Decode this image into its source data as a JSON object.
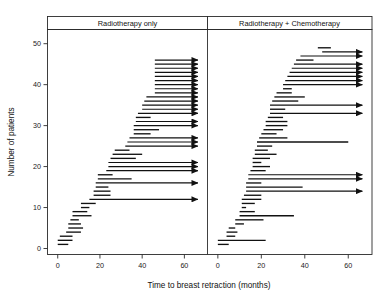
{
  "figure": {
    "title": "",
    "xlabel": "Time to breast retraction (months)",
    "ylabel": "Number of patients"
  },
  "chart_data": {
    "type": "line",
    "title": "",
    "xlabel": "Time to breast retraction (months)",
    "ylabel": "Number of patients",
    "xlim": [
      -2,
      70
    ],
    "ylim": [
      0,
      52
    ],
    "xticks": [
      0,
      20,
      40,
      60
    ],
    "yticks": [
      0,
      10,
      20,
      30,
      40,
      50
    ],
    "grid": false,
    "legend": "none",
    "panel_layout": "two-panels-side-by-side",
    "annotation": "Interval-censored observation times; arrows denote right-censored intervals extending beyond the observation window.",
    "panels": [
      {
        "name": "radiotherapy-only",
        "label": "Radiotherapy only",
        "n": 46,
        "intervals": [
          {
            "y": 1,
            "left": 0,
            "right": 5,
            "censored": false
          },
          {
            "y": 2,
            "left": 0,
            "right": 7,
            "censored": false
          },
          {
            "y": 3,
            "left": 1,
            "right": 7,
            "censored": false
          },
          {
            "y": 4,
            "left": 4,
            "right": 11,
            "censored": false
          },
          {
            "y": 5,
            "left": 5,
            "right": 12,
            "censored": false
          },
          {
            "y": 6,
            "left": 5,
            "right": 11,
            "censored": false
          },
          {
            "y": 7,
            "left": 6,
            "right": 10,
            "censored": false
          },
          {
            "y": 8,
            "left": 7,
            "right": 16,
            "censored": false
          },
          {
            "y": 9,
            "left": 7,
            "right": 14,
            "censored": false
          },
          {
            "y": 10,
            "left": 11,
            "right": 15,
            "censored": false
          },
          {
            "y": 11,
            "left": 11,
            "right": 18,
            "censored": false
          },
          {
            "y": 12,
            "left": 15,
            "right": 69,
            "censored": true
          },
          {
            "y": 13,
            "left": 17,
            "right": 25,
            "censored": false
          },
          {
            "y": 14,
            "left": 17,
            "right": 25,
            "censored": false
          },
          {
            "y": 15,
            "left": 18,
            "right": 24,
            "censored": false
          },
          {
            "y": 16,
            "left": 18,
            "right": 69,
            "censored": true
          },
          {
            "y": 17,
            "left": 19,
            "right": 35,
            "censored": false
          },
          {
            "y": 18,
            "left": 19,
            "right": 26,
            "censored": false
          },
          {
            "y": 19,
            "left": 23,
            "right": 69,
            "censored": true
          },
          {
            "y": 20,
            "left": 24,
            "right": 69,
            "censored": true
          },
          {
            "y": 21,
            "left": 24,
            "right": 69,
            "censored": true
          },
          {
            "y": 22,
            "left": 25,
            "right": 37,
            "censored": false
          },
          {
            "y": 23,
            "left": 26,
            "right": 40,
            "censored": false
          },
          {
            "y": 24,
            "left": 27,
            "right": 34,
            "censored": false
          },
          {
            "y": 25,
            "left": 32,
            "right": 69,
            "censored": true
          },
          {
            "y": 26,
            "left": 33,
            "right": 69,
            "censored": true
          },
          {
            "y": 27,
            "left": 34,
            "right": 69,
            "censored": true
          },
          {
            "y": 28,
            "left": 36,
            "right": 44,
            "censored": false
          },
          {
            "y": 29,
            "left": 36,
            "right": 48,
            "censored": false
          },
          {
            "y": 30,
            "left": 36,
            "right": 69,
            "censored": true
          },
          {
            "y": 31,
            "left": 37,
            "right": 69,
            "censored": true
          },
          {
            "y": 32,
            "left": 37,
            "right": 44,
            "censored": false
          },
          {
            "y": 33,
            "left": 38,
            "right": 69,
            "censored": true
          },
          {
            "y": 34,
            "left": 40,
            "right": 69,
            "censored": true
          },
          {
            "y": 35,
            "left": 40,
            "right": 69,
            "censored": true
          },
          {
            "y": 36,
            "left": 41,
            "right": 69,
            "censored": true
          },
          {
            "y": 37,
            "left": 42,
            "right": 69,
            "censored": true
          },
          {
            "y": 38,
            "left": 46,
            "right": 69,
            "censored": true
          },
          {
            "y": 39,
            "left": 46,
            "right": 69,
            "censored": true
          },
          {
            "y": 40,
            "left": 46,
            "right": 69,
            "censored": true
          },
          {
            "y": 41,
            "left": 46,
            "right": 69,
            "censored": true
          },
          {
            "y": 42,
            "left": 46,
            "right": 69,
            "censored": true
          },
          {
            "y": 43,
            "left": 46,
            "right": 69,
            "censored": true
          },
          {
            "y": 44,
            "left": 46,
            "right": 69,
            "censored": true
          },
          {
            "y": 45,
            "left": 46,
            "right": 69,
            "censored": true
          },
          {
            "y": 46,
            "left": 46,
            "right": 69,
            "censored": true
          }
        ]
      },
      {
        "name": "radiotherapy-plus-chemotherapy",
        "label": "Radiotherapy + Chemotherapy",
        "n": 48,
        "intervals": [
          {
            "y": 1,
            "left": 0,
            "right": 5,
            "censored": false
          },
          {
            "y": 2,
            "left": 0,
            "right": 22,
            "censored": false
          },
          {
            "y": 3,
            "left": 4,
            "right": 8,
            "censored": false
          },
          {
            "y": 4,
            "left": 4,
            "right": 9,
            "censored": false
          },
          {
            "y": 5,
            "left": 5,
            "right": 8,
            "censored": false
          },
          {
            "y": 6,
            "left": 8,
            "right": 12,
            "censored": false
          },
          {
            "y": 7,
            "left": 8,
            "right": 21,
            "censored": false
          },
          {
            "y": 8,
            "left": 10,
            "right": 35,
            "censored": false
          },
          {
            "y": 9,
            "left": 10,
            "right": 17,
            "censored": false
          },
          {
            "y": 10,
            "left": 11,
            "right": 13,
            "censored": false
          },
          {
            "y": 11,
            "left": 11,
            "right": 17,
            "censored": false
          },
          {
            "y": 12,
            "left": 11,
            "right": 20,
            "censored": false
          },
          {
            "y": 13,
            "left": 12,
            "right": 20,
            "censored": false
          },
          {
            "y": 14,
            "left": 13,
            "right": 69,
            "censored": true
          },
          {
            "y": 15,
            "left": 13,
            "right": 39,
            "censored": false
          },
          {
            "y": 16,
            "left": 13,
            "right": 20,
            "censored": false
          },
          {
            "y": 17,
            "left": 14,
            "right": 69,
            "censored": true
          },
          {
            "y": 18,
            "left": 14,
            "right": 69,
            "censored": true
          },
          {
            "y": 19,
            "left": 15,
            "right": 22,
            "censored": false
          },
          {
            "y": 20,
            "left": 16,
            "right": 24,
            "censored": false
          },
          {
            "y": 21,
            "left": 16,
            "right": 20,
            "censored": false
          },
          {
            "y": 22,
            "left": 16,
            "right": 24,
            "censored": false
          },
          {
            "y": 23,
            "left": 17,
            "right": 27,
            "censored": false
          },
          {
            "y": 24,
            "left": 17,
            "right": 23,
            "censored": false
          },
          {
            "y": 25,
            "left": 18,
            "right": 25,
            "censored": false
          },
          {
            "y": 26,
            "left": 18,
            "right": 60,
            "censored": false
          },
          {
            "y": 27,
            "left": 19,
            "right": 32,
            "censored": false
          },
          {
            "y": 28,
            "left": 20,
            "right": 27,
            "censored": false
          },
          {
            "y": 29,
            "left": 21,
            "right": 30,
            "censored": false
          },
          {
            "y": 30,
            "left": 22,
            "right": 32,
            "censored": false
          },
          {
            "y": 31,
            "left": 22,
            "right": 32,
            "censored": false
          },
          {
            "y": 32,
            "left": 23,
            "right": 30,
            "censored": false
          },
          {
            "y": 33,
            "left": 24,
            "right": 69,
            "censored": true
          },
          {
            "y": 34,
            "left": 24,
            "right": 31,
            "censored": false
          },
          {
            "y": 35,
            "left": 24,
            "right": 69,
            "censored": true
          },
          {
            "y": 36,
            "left": 25,
            "right": 37,
            "censored": false
          },
          {
            "y": 37,
            "left": 26,
            "right": 40,
            "censored": false
          },
          {
            "y": 38,
            "left": 27,
            "right": 34,
            "censored": false
          },
          {
            "y": 39,
            "left": 30,
            "right": 34,
            "censored": false
          },
          {
            "y": 40,
            "left": 30,
            "right": 69,
            "censored": true
          },
          {
            "y": 41,
            "left": 31,
            "right": 69,
            "censored": true
          },
          {
            "y": 42,
            "left": 32,
            "right": 69,
            "censored": true
          },
          {
            "y": 43,
            "left": 33,
            "right": 69,
            "censored": true
          },
          {
            "y": 44,
            "left": 34,
            "right": 69,
            "censored": true
          },
          {
            "y": 45,
            "left": 35,
            "right": 69,
            "censored": true
          },
          {
            "y": 46,
            "left": 36,
            "right": 44,
            "censored": false
          },
          {
            "y": 47,
            "left": 38,
            "right": 69,
            "censored": true
          },
          {
            "y": 48,
            "left": 48,
            "right": 69,
            "censored": true
          },
          {
            "y": 49,
            "left": 46,
            "right": 52,
            "censored": false
          }
        ]
      }
    ]
  }
}
